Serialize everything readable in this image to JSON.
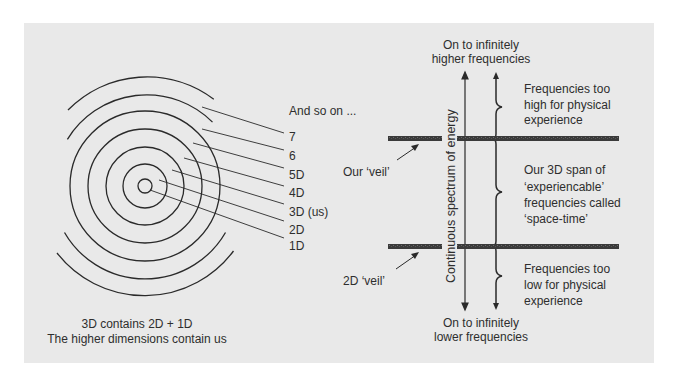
{
  "colors": {
    "background": "#ffffff",
    "panel": "#e9e9e9",
    "line": "#2a2a2a",
    "veil": "#3a3a3a",
    "text": "#2e2e2e"
  },
  "left_diagram": {
    "name": "dimensions-concentric-circles",
    "center": [
      145,
      186
    ],
    "full_circle_radii": [
      7,
      22,
      39,
      57,
      75
    ],
    "arc_radii": [
      93,
      111
    ],
    "labels": [
      {
        "text": "And so on ...",
        "x": 289,
        "y": 104
      },
      {
        "text": "7",
        "x": 289,
        "y": 130
      },
      {
        "text": "6",
        "x": 289,
        "y": 149
      },
      {
        "text": "5D",
        "x": 289,
        "y": 168
      },
      {
        "text": "4D",
        "x": 289,
        "y": 186
      },
      {
        "text": "3D (us)",
        "x": 289,
        "y": 205
      },
      {
        "text": "2D",
        "x": 289,
        "y": 223
      },
      {
        "text": "1D",
        "x": 289,
        "y": 239
      }
    ],
    "caption": {
      "line1": "3D contains 2D + 1D",
      "line2": "The higher dimensions contain us"
    }
  },
  "right_diagram": {
    "name": "frequency-spectrum",
    "top_label": {
      "line1": "On to infinitely",
      "line2": "higher frequencies"
    },
    "bottom_label": {
      "line1": "On to infinitely",
      "line2": "lower frequencies"
    },
    "axis_label": "Continuous spectrum of energy",
    "veils": [
      {
        "label": "Our ‘veil’",
        "y": 139
      },
      {
        "label": "2D ‘veil’",
        "y": 246
      }
    ],
    "regions": [
      {
        "lines": [
          "Frequencies too",
          "high for physical",
          "experience"
        ]
      },
      {
        "lines": [
          "Our 3D span of",
          "‘experiencable’",
          "frequencies called",
          "‘space-time’"
        ]
      },
      {
        "lines": [
          "Frequencies too",
          "low for physical",
          "experience"
        ]
      }
    ]
  }
}
